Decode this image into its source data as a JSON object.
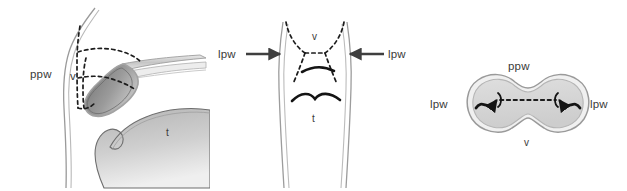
{
  "figure": {
    "background_color": "#ffffff",
    "width": 627,
    "height": 191,
    "label_color": "#3a3a3a",
    "outline_color": "#8d8d8d",
    "dashed_color": "#1a1a1a",
    "arrow_color": "#3f3f3f",
    "tissue_fill_light": "#d9d9d9",
    "tissue_fill_mid": "#a8a8a8",
    "tissue_fill_dark": "#7d7d7d"
  },
  "panels": [
    {
      "id": "sagittal",
      "name": "sagittal-view",
      "labels": [
        {
          "key": "ppw",
          "text": "ppw",
          "x": 30,
          "y": 74,
          "meaning": "posterior pharyngeal wall"
        },
        {
          "key": "v",
          "text": "v",
          "x": 71,
          "y": 77,
          "meaning": "velum"
        },
        {
          "key": "t",
          "text": "t",
          "x": 166,
          "y": 133,
          "meaning": "tongue"
        }
      ]
    },
    {
      "id": "frontal",
      "name": "frontal-view",
      "labels": [
        {
          "key": "lpw-left",
          "text": "lpw",
          "x": 14,
          "y": 58,
          "meaning": "lateral pharyngeal wall"
        },
        {
          "key": "v",
          "text": "v",
          "x": 107,
          "y": 39,
          "meaning": "velum"
        },
        {
          "key": "lpw-right",
          "text": "lpw",
          "x": 162,
          "y": 58,
          "meaning": "lateral pharyngeal wall"
        },
        {
          "key": "t",
          "text": "t",
          "x": 106,
          "y": 117,
          "meaning": "tongue"
        }
      ]
    },
    {
      "id": "axial",
      "name": "axial-view",
      "labels": [
        {
          "key": "ppw",
          "text": "ppw",
          "x": 91,
          "y": 78,
          "meaning": "posterior pharyngeal wall"
        },
        {
          "key": "lpw-left",
          "text": "lpw",
          "x": 15,
          "y": 107,
          "meaning": "lateral pharyngeal wall"
        },
        {
          "key": "lpw-right",
          "text": "lpw",
          "x": 155,
          "y": 107,
          "meaning": "lateral pharyngeal wall"
        },
        {
          "key": "v",
          "text": "v",
          "x": 96,
          "y": 145,
          "meaning": "velum"
        }
      ]
    }
  ]
}
